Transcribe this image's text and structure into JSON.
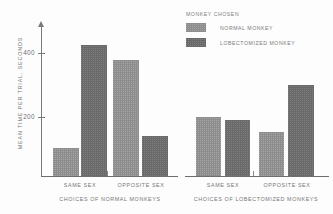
{
  "chart_data": {
    "type": "bar",
    "title": "",
    "xlabel": "",
    "ylabel": "MEAN TIME PER TRIAL, SECONDS",
    "ylim": [
      0,
      480
    ],
    "yticks": [
      200,
      400
    ],
    "ytick_labels": [
      "200",
      "400"
    ],
    "grid": false,
    "legend_title": "MONKEY CHOSEN",
    "legend_position": "top-center",
    "groups": [
      {
        "group_label": "CHOICES OF NORMAL MONKEYS",
        "categories": [
          "SAME SEX",
          "OPPOSITE SEX"
        ]
      },
      {
        "group_label": "CHOICES OF LOBECTOMIZED MONKEYS",
        "categories": [
          "SAME SEX",
          "OPPOSITE SEX"
        ]
      }
    ],
    "categories": [
      "SAME SEX",
      "OPPOSITE SEX",
      "SAME SEX",
      "OPPOSITE SEX"
    ],
    "series": [
      {
        "name": "NORMAL MONKEY",
        "color": "#8d8d8d",
        "values": [
          95,
          393,
          200,
          150
        ]
      },
      {
        "name": "LOBECTOMIZED MONKEY",
        "color": "#6a6a6a",
        "values": [
          445,
          136,
          190,
          308
        ]
      }
    ],
    "bars": [
      {
        "id": "bar-normal-samesex-normal",
        "group": 0,
        "category": "SAME SEX",
        "series": "NORMAL MONKEY",
        "value": 95,
        "color": "#8d8d8d"
      },
      {
        "id": "bar-normal-samesex-lobect",
        "group": 0,
        "category": "SAME SEX",
        "series": "LOBECTOMIZED MONKEY",
        "value": 445,
        "color": "#6a6a6a"
      },
      {
        "id": "bar-normal-oppsex-normal",
        "group": 0,
        "category": "OPPOSITE SEX",
        "series": "NORMAL MONKEY",
        "value": 393,
        "color": "#8d8d8d"
      },
      {
        "id": "bar-normal-oppsex-lobect",
        "group": 0,
        "category": "OPPOSITE SEX",
        "series": "LOBECTOMIZED MONKEY",
        "value": 136,
        "color": "#6a6a6a"
      },
      {
        "id": "bar-lobect-samesex-normal",
        "group": 1,
        "category": "SAME SEX",
        "series": "NORMAL MONKEY",
        "value": 200,
        "color": "#8d8d8d"
      },
      {
        "id": "bar-lobect-samesex-lobect",
        "group": 1,
        "category": "SAME SEX",
        "series": "LOBECTOMIZED MONKEY",
        "value": 190,
        "color": "#6a6a6a"
      },
      {
        "id": "bar-lobect-oppsex-normal",
        "group": 1,
        "category": "OPPOSITE SEX",
        "series": "NORMAL MONKEY",
        "value": 150,
        "color": "#8d8d8d"
      },
      {
        "id": "bar-lobect-oppsex-lobect",
        "group": 1,
        "category": "OPPOSITE SEX",
        "series": "LOBECTOMIZED MONKEY",
        "value": 308,
        "color": "#6a6a6a"
      }
    ]
  },
  "legend": {
    "title": "MONKEY CHOSEN",
    "items": [
      {
        "label": "NORMAL MONKEY",
        "color": "#8d8d8d"
      },
      {
        "label": "LOBECTOMIZED MONKEY",
        "color": "#6a6a6a"
      }
    ]
  },
  "axis": {
    "y_label": "MEAN TIME PER TRIAL, SECONDS",
    "tick_400": "400",
    "tick_200": "200"
  },
  "labels": {
    "left_cat_1": "SAME SEX",
    "left_cat_2": "OPPOSITE SEX",
    "left_group": "CHOICES OF NORMAL MONKEYS",
    "right_cat_1": "SAME SEX",
    "right_cat_2": "OPPOSITE SEX",
    "right_group": "CHOICES OF LOBECTOMIZED MONKEYS"
  }
}
